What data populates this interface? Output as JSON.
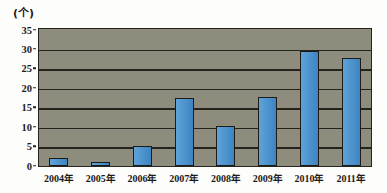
{
  "unit_label": "(个)",
  "chart_data": {
    "type": "bar",
    "title": "",
    "subtitle": "",
    "xlabel": "",
    "ylabel": "(个)",
    "categories": [
      "2004年",
      "2005年",
      "2006年",
      "2007年",
      "2008年",
      "2009年",
      "2010年",
      "2011年"
    ],
    "values": [
      2,
      1,
      5,
      17.4,
      10.2,
      17.6,
      29.5,
      27.6
    ],
    "series": [
      {
        "name": "",
        "values": [
          2,
          1,
          5,
          17.4,
          10.2,
          17.6,
          29.5,
          27.6
        ]
      }
    ],
    "ylim": [
      0,
      35
    ],
    "yticks": [
      0,
      5,
      10,
      15,
      20,
      25,
      30,
      35
    ],
    "ytick_labels": [
      "0",
      "5",
      "10",
      "15",
      "20",
      "25",
      "30",
      "35"
    ],
    "grid": true,
    "grid_axis": "y",
    "legend": false,
    "legend_position": "none",
    "bar_color": "#4f95ce",
    "bar_edge_color": "#1d1b18",
    "plot_background": "#8e8c7c",
    "axis_color": "#24221d"
  }
}
